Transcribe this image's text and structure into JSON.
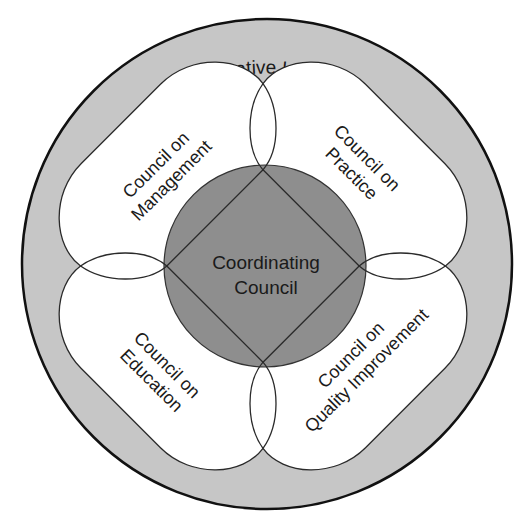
{
  "diagram": {
    "outer_ring": {
      "label": "Administrative Integration",
      "fill": "#c6c6c6",
      "stroke": "#111111"
    },
    "center": {
      "line1": "Coordinating",
      "line2": "Council",
      "fill": "#8e8e8e"
    },
    "petals": [
      {
        "id": "management",
        "line1": "Council on",
        "line2": "Management",
        "position": "top-left"
      },
      {
        "id": "practice",
        "line1": "Council on",
        "line2": "Practice",
        "position": "top-right"
      },
      {
        "id": "education",
        "line1": "Council on",
        "line2": "Education",
        "position": "bottom-left"
      },
      {
        "id": "quality",
        "line1": "Council on",
        "line2": "Quality Improvement",
        "position": "bottom-right"
      }
    ],
    "petal_fill": "#ffffff"
  }
}
